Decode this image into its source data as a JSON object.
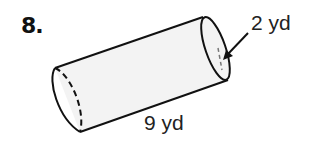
{
  "problem": {
    "number": "8.",
    "shape": "cylinder",
    "labels": {
      "diameter": "2 yd",
      "length": "9 yd"
    }
  },
  "colors": {
    "stroke": "#111111",
    "fill": "#f2f2f2",
    "background": "#ffffff"
  }
}
